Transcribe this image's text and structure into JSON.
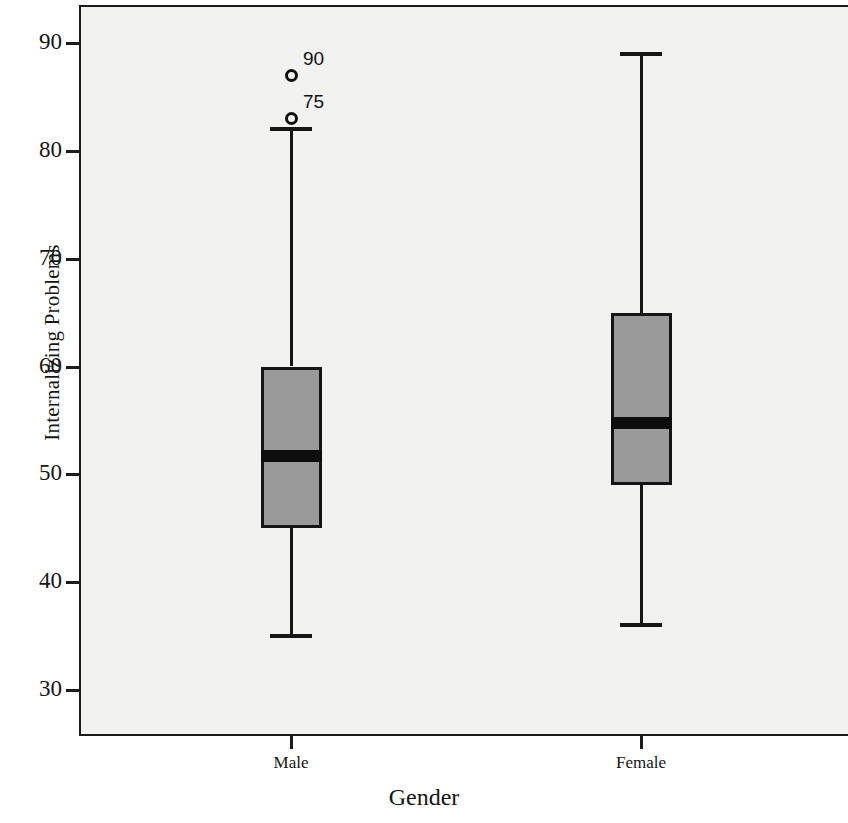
{
  "chart_data": {
    "type": "box",
    "title": "",
    "xlabel": "Gender",
    "ylabel": "Internalizing Problems",
    "categories": [
      "Male",
      "Female"
    ],
    "ylim": [
      27,
      93
    ],
    "yticks": [
      30,
      40,
      50,
      60,
      70,
      80,
      90
    ],
    "ytick_labels": [
      "30",
      "40",
      "50",
      "60",
      "70",
      "80",
      "90"
    ],
    "grid": false,
    "legend": "none",
    "background": "#f2f2f0",
    "box_fill_color": "#9a9a9a",
    "box_edge_color": "#151515",
    "boxes": [
      {
        "category": "Male",
        "whisker_low": 35,
        "q1": 45,
        "median": 51.7,
        "q3": 60,
        "whisker_high": 82,
        "outliers": [
          {
            "label": "75",
            "value": 83
          },
          {
            "label": "90",
            "value": 87
          }
        ]
      },
      {
        "category": "Female",
        "whisker_low": 36,
        "q1": 49,
        "median": 54.8,
        "q3": 65,
        "whisker_high": 89,
        "outliers": []
      }
    ]
  }
}
